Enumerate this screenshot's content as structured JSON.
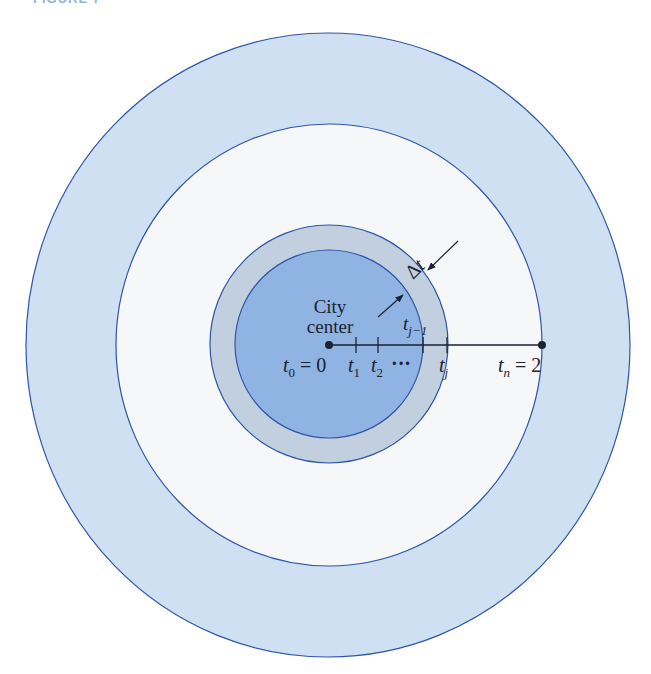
{
  "figure": {
    "caption": "FIGURE 7",
    "colors": {
      "outer_ring": "#cfe0f3",
      "white_ring": "#f5f7f9",
      "gray_ring": "#c2cfdf",
      "inner_disk": "#8fb3e2",
      "stroke": "#2d55a8",
      "ink": "#1b2230"
    },
    "labels": {
      "city": "City",
      "center": "center",
      "delta": "Δ",
      "delta_var": "t",
      "t0": "t",
      "t0_sub": "0",
      "t0_eq": " = 0",
      "t1": "t",
      "t1_sub": "1",
      "t2": "t",
      "t2_sub": "2",
      "dots": "···",
      "tj1": "t",
      "tj1_sub": "j−1",
      "tj": "t",
      "tj_sub": "j",
      "tn": "t",
      "tn_sub": "n",
      "tn_eq": " = 2"
    }
  }
}
